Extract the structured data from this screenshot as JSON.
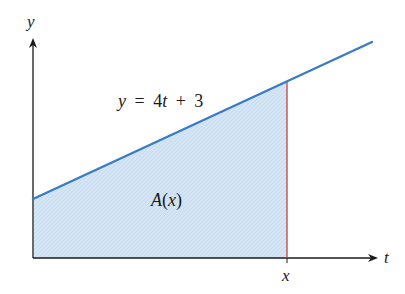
{
  "diagram": {
    "type": "area-under-line",
    "axes": {
      "vertical_label": "y",
      "horizontal_label": "t"
    },
    "line": {
      "equation_y": "y",
      "equation_eq": "=",
      "equation_rhs_num": "4",
      "equation_rhs_var": "t",
      "equation_plus": "+",
      "equation_const": "3",
      "color": "#3a7bc8"
    },
    "shaded_region": {
      "label_fn": "A",
      "label_arg": "x",
      "fill_color": "#cfe2f3"
    },
    "bound": {
      "label": "x",
      "color": "#d43a3a"
    }
  }
}
